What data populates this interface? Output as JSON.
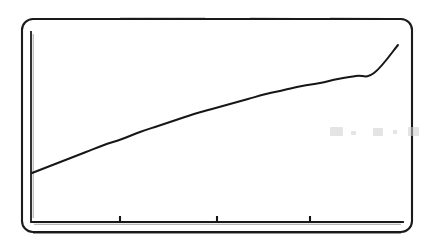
{
  "figure": {
    "kind": "scanned-line-chart",
    "title": "",
    "subtitle": "",
    "background_color": "#ffffff",
    "ink_color": "#161616",
    "ghost_color": "#cfcdcb"
  },
  "frame": {
    "name": "rounded-border",
    "x": 22,
    "y": 19,
    "width": 390,
    "height": 213,
    "corner_radius": 11,
    "stroke_width": 2.1,
    "stroke_color": "#1a1a1a"
  },
  "axes": {
    "y_axis": {
      "x": 31,
      "y_top": 32,
      "y_bottom": 220,
      "stroke_width": 1.8,
      "has_ticks": false,
      "tick_labels": []
    },
    "x_axis": {
      "y": 222,
      "x_left": 31,
      "x_right": 403,
      "stroke_width": 1.8,
      "tick_direction": "up",
      "tick_length": 6,
      "tick_positions_px": [
        120,
        217,
        310
      ],
      "tick_labels": []
    },
    "axis_label_x": "",
    "axis_label_y": "",
    "grid": "off",
    "legend": "none"
  },
  "chart_data": {
    "type": "line",
    "title": "",
    "subtitle": "",
    "xlabel": "",
    "ylabel": "",
    "grid": false,
    "legend_position": "none",
    "xlim": [
      0,
      100
    ],
    "ylim": [
      0,
      100
    ],
    "axis_tick_labels": {
      "x": [],
      "y": []
    },
    "annotations": [],
    "series": [
      {
        "name": "curve",
        "style": "solid",
        "color": "#161616",
        "line_width": 2.0,
        "markers": "none",
        "shape": "increasing-concave-down (saturating / logarithmic)",
        "x": [
          0,
          5,
          10,
          15,
          20,
          25,
          30,
          35,
          40,
          45,
          50,
          55,
          60,
          65,
          70,
          75,
          80,
          85,
          90,
          95,
          100
        ],
        "y": [
          36.4,
          40.0,
          43.6,
          47.1,
          50.5,
          53.8,
          57.0,
          60.1,
          63.1,
          66.0,
          68.7,
          71.3,
          73.8,
          76.1,
          78.3,
          80.4,
          82.3,
          84.1,
          85.8,
          87.4,
          88.8
        ],
        "pixel_points": [
          [
            32,
            173
          ],
          [
            50,
            166
          ],
          [
            68,
            159
          ],
          [
            86,
            152
          ],
          [
            104,
            145
          ],
          [
            122,
            139
          ],
          [
            140,
            132
          ],
          [
            158,
            126
          ],
          [
            176,
            120
          ],
          [
            194,
            114
          ],
          [
            212,
            109
          ],
          [
            230,
            104
          ],
          [
            248,
            99
          ],
          [
            266,
            94
          ],
          [
            284,
            90
          ],
          [
            302,
            86
          ],
          [
            320,
            83
          ],
          [
            338,
            79
          ],
          [
            356,
            76
          ],
          [
            374,
            73
          ],
          [
            398,
            45
          ]
        ],
        "start_pixel": [
          32,
          173
        ],
        "end_pixel": [
          398,
          45
        ]
      }
    ]
  },
  "artifacts": [
    {
      "name": "ghost-smudge-a",
      "x": 330,
      "y": 127,
      "width": 13,
      "height": 9
    },
    {
      "name": "ghost-smudge-b",
      "x": 351,
      "y": 131,
      "width": 5,
      "height": 4
    },
    {
      "name": "ghost-smudge-c",
      "x": 373,
      "y": 128,
      "width": 10,
      "height": 8
    },
    {
      "name": "ghost-smudge-d",
      "x": 393,
      "y": 130,
      "width": 4,
      "height": 4
    },
    {
      "name": "ghost-smudge-e",
      "x": 408,
      "y": 127,
      "width": 11,
      "height": 9
    }
  ],
  "accessibility": {
    "alt_text": "Photocopied line chart showing a single curve rising steeply at first then flattening toward the right, drawn inside a rounded rectangular frame with three unlabeled tick marks on the horizontal axis."
  }
}
